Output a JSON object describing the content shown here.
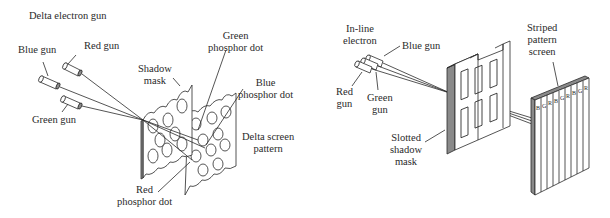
{
  "left_diagram": {
    "title": "Delta electron gun",
    "labels": {
      "blue_gun": "Blue gun",
      "red_gun": "Red gun",
      "green_gun": "Green gun",
      "shadow_mask_1": "Shadow",
      "shadow_mask_2": "mask",
      "green_dot_1": "Green",
      "green_dot_2": "phosphor dot",
      "blue_dot_1": "Blue",
      "blue_dot_2": "phosphor dot",
      "delta_screen_1": "Delta screen",
      "delta_screen_2": "pattern",
      "red_dot_1": "Red",
      "red_dot_2": "phosphor dot"
    }
  },
  "right_diagram": {
    "labels": {
      "inline_1": "In-line",
      "inline_2": "electron",
      "blue_gun": "Blue gun",
      "red_gun_1": "Red",
      "red_gun_2": "gun",
      "green_gun_1": "Green",
      "green_gun_2": "gun",
      "slotted_1": "Slotted",
      "slotted_2": "shadow",
      "slotted_3": "mask",
      "striped_1": "Striped",
      "striped_2": "pattern",
      "striped_3": "screen"
    },
    "stripe_letters": [
      "B",
      "G",
      "R",
      "B",
      "G",
      "R",
      "B",
      "G",
      "R"
    ]
  },
  "colors": {
    "line": "#2a2a2a",
    "edge_fill": "#8a8a8a",
    "background": "#ffffff"
  }
}
